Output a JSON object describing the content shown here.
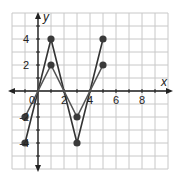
{
  "chart_data": {
    "type": "line",
    "title": "",
    "xlabel": "x",
    "ylabel": "y",
    "xlim": [
      -2,
      10
    ],
    "ylim": [
      -6,
      6
    ],
    "grid": true,
    "x_ticks": [
      2,
      4,
      6,
      8
    ],
    "y_ticks": [
      4,
      2,
      -2,
      -4
    ],
    "origin_label": "0",
    "series": [
      {
        "name": "steep",
        "x": [
          -1,
          1,
          3,
          5
        ],
        "y": [
          -4,
          4,
          -4,
          4
        ],
        "color": "#333333"
      },
      {
        "name": "shallow",
        "x": [
          -1,
          1,
          3,
          5
        ],
        "y": [
          -2,
          2,
          -2,
          2
        ],
        "color": "#555555"
      }
    ]
  },
  "colors": {
    "grid": "#c8c8c8",
    "axis": "#222222",
    "point": "#3a3a3a"
  }
}
